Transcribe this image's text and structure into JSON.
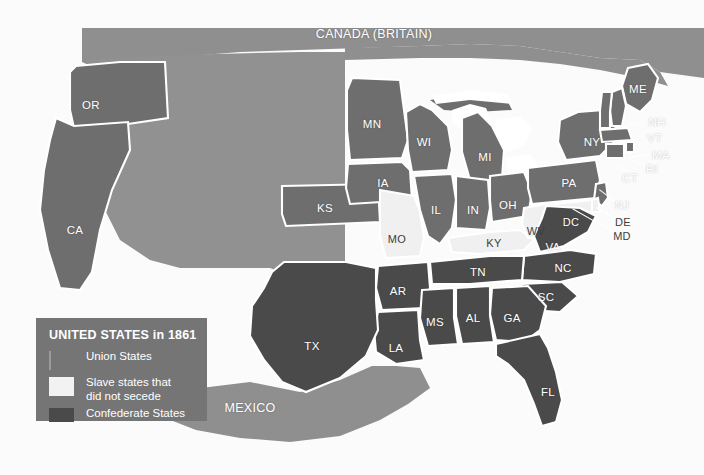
{
  "map": {
    "title_top": "CANADA (BRITAIN)",
    "bottom_country": "MEXICO",
    "palette": {
      "territory": "#919191",
      "union": "#6e6e6e",
      "confederate": "#4a4a4a",
      "border_slave": "#f0f0f0",
      "ocean": "#fbfbfb",
      "canada": "#8f8f8f",
      "mexico": "#8f8f8f",
      "lakes": "#ffffff",
      "outline": "#ffffff",
      "label": "#ffffff"
    },
    "legend": {
      "title": "UNITED STATES in 1861",
      "items": [
        {
          "label": "Union States",
          "swatch": "#757575",
          "category": "union"
        },
        {
          "label": "Slave states that\ndid not secede",
          "label_line1": "Slave states that",
          "label_line2": "did not secede",
          "swatch": "#f2f2f2",
          "category": "border-slave"
        },
        {
          "label": "Confederate States",
          "swatch": "#4a4a4a",
          "category": "confederate"
        }
      ]
    },
    "states": [
      {
        "code": "OR",
        "name": "Oregon",
        "category": "union",
        "x": 91,
        "y": 105
      },
      {
        "code": "CA",
        "name": "California",
        "category": "union",
        "x": 75,
        "y": 230
      },
      {
        "code": "MN",
        "name": "Minnesota",
        "category": "union",
        "x": 372,
        "y": 124
      },
      {
        "code": "WI",
        "name": "Wisconsin",
        "category": "union",
        "x": 424,
        "y": 142
      },
      {
        "code": "MI",
        "name": "Michigan",
        "category": "union",
        "x": 485,
        "y": 157
      },
      {
        "code": "IA",
        "name": "Iowa",
        "category": "union",
        "x": 383,
        "y": 183
      },
      {
        "code": "IL",
        "name": "Illinois",
        "category": "union",
        "x": 436,
        "y": 210
      },
      {
        "code": "IN",
        "name": "Indiana",
        "category": "union",
        "x": 473,
        "y": 210
      },
      {
        "code": "OH",
        "name": "Ohio",
        "category": "union",
        "x": 508,
        "y": 205
      },
      {
        "code": "KS",
        "name": "Kansas",
        "category": "union",
        "x": 325,
        "y": 208
      },
      {
        "code": "MO",
        "name": "Missouri",
        "category": "border-slave",
        "x": 397,
        "y": 239
      },
      {
        "code": "KY",
        "name": "Kentucky",
        "category": "border-slave",
        "x": 494,
        "y": 243
      },
      {
        "code": "WV",
        "name": "West Virginia",
        "category": "border-slave",
        "x": 536,
        "y": 231
      },
      {
        "code": "NY",
        "name": "New York",
        "category": "union",
        "x": 592,
        "y": 142
      },
      {
        "code": "PA",
        "name": "Pennsylvania",
        "category": "union",
        "x": 569,
        "y": 183
      },
      {
        "code": "ME",
        "name": "Maine",
        "category": "union",
        "x": 638,
        "y": 89
      },
      {
        "code": "NH",
        "name": "New Hampshire",
        "category": "union",
        "x": 657,
        "y": 122
      },
      {
        "code": "VT",
        "name": "Vermont",
        "category": "union",
        "x": 655,
        "y": 138
      },
      {
        "code": "MA",
        "name": "Massachusetts",
        "category": "union",
        "x": 661,
        "y": 155
      },
      {
        "code": "RI",
        "name": "Rhode Island",
        "category": "union",
        "x": 652,
        "y": 169
      },
      {
        "code": "CT",
        "name": "Connecticut",
        "category": "union",
        "x": 630,
        "y": 178
      },
      {
        "code": "NJ",
        "name": "New Jersey",
        "category": "union",
        "x": 622,
        "y": 205
      },
      {
        "code": "DE",
        "name": "Delaware",
        "category": "border-slave",
        "x": 623,
        "y": 222
      },
      {
        "code": "MD",
        "name": "Maryland",
        "category": "border-slave",
        "x": 622,
        "y": 236
      },
      {
        "code": "DC",
        "name": "District of Columbia",
        "category": "border-slave",
        "x": 571,
        "y": 222
      },
      {
        "code": "VA",
        "name": "Virginia",
        "category": "confederate",
        "x": 553,
        "y": 247
      },
      {
        "code": "NC",
        "name": "North Carolina",
        "category": "confederate",
        "x": 563,
        "y": 268
      },
      {
        "code": "SC",
        "name": "South Carolina",
        "category": "confederate",
        "x": 546,
        "y": 297
      },
      {
        "code": "TN",
        "name": "Tennessee",
        "category": "confederate",
        "x": 478,
        "y": 272
      },
      {
        "code": "AR",
        "name": "Arkansas",
        "category": "confederate",
        "x": 398,
        "y": 291
      },
      {
        "code": "GA",
        "name": "Georgia",
        "category": "confederate",
        "x": 512,
        "y": 318
      },
      {
        "code": "AL",
        "name": "Alabama",
        "category": "confederate",
        "x": 473,
        "y": 318
      },
      {
        "code": "MS",
        "name": "Mississippi",
        "category": "confederate",
        "x": 435,
        "y": 322
      },
      {
        "code": "LA",
        "name": "Louisiana",
        "category": "confederate",
        "x": 396,
        "y": 348
      },
      {
        "code": "TX",
        "name": "Texas",
        "category": "confederate",
        "x": 312,
        "y": 346
      },
      {
        "code": "FL",
        "name": "Florida",
        "category": "confederate",
        "x": 548,
        "y": 392
      }
    ],
    "leaders": [
      {
        "from": "NH",
        "x1": 646,
        "y1": 122,
        "x2": 608,
        "y2": 130
      },
      {
        "from": "VT",
        "x1": 644,
        "y1": 138,
        "x2": 617,
        "y2": 144
      },
      {
        "from": "MA",
        "x1": 650,
        "y1": 155,
        "x2": 627,
        "y2": 158
      },
      {
        "from": "RI",
        "x1": 645,
        "y1": 166,
        "x2": 629,
        "y2": 160
      },
      {
        "from": "CT",
        "x1": 627,
        "y1": 172,
        "x2": 614,
        "y2": 165
      },
      {
        "from": "NJ",
        "x1": 615,
        "y1": 202,
        "x2": 599,
        "y2": 190
      },
      {
        "from": "DE",
        "x1": 616,
        "y1": 219,
        "x2": 596,
        "y2": 208
      },
      {
        "from": "MD",
        "x1": 614,
        "y1": 233,
        "x2": 572,
        "y2": 209
      }
    ]
  }
}
